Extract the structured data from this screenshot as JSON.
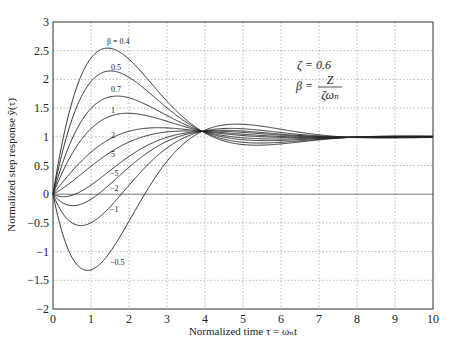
{
  "chart_data": {
    "type": "line",
    "title": "",
    "xlabel": "Normalized time τ = ωₙt",
    "ylabel": "Normalized step response ỹ(τ)",
    "xlim": [
      0,
      10
    ],
    "ylim": [
      -2,
      3
    ],
    "xticks": [
      0,
      1,
      2,
      3,
      4,
      5,
      6,
      7,
      8,
      9,
      10
    ],
    "yticks": [
      -2,
      -1.5,
      -1,
      -0.5,
      0,
      0.5,
      1,
      1.5,
      2,
      2.5,
      3
    ],
    "ytick_labels": [
      "−2",
      "−1.5",
      "−1",
      "−0.5",
      "0",
      "0.5",
      "1",
      "1.5",
      "2",
      "2.5",
      "3"
    ],
    "grid": true,
    "zeta": 0.6,
    "model": "y(τ) = y0(τ) + (1/(βζ))·dy0/dτ, second-order step response with zero",
    "annotations": {
      "zeta_text": "ζ = 0.6",
      "beta_lhs": "β =",
      "beta_num": "Z",
      "beta_den": "ζωₙ"
    },
    "series": [
      {
        "name": "β = 0.4",
        "beta": 0.4,
        "label": "β = 0.4",
        "peak": [
          1.45,
          2.55
        ]
      },
      {
        "name": "β = 0.5",
        "beta": 0.5,
        "label": "0.5",
        "peak": [
          1.45,
          2.13
        ]
      },
      {
        "name": "β = 0.7",
        "beta": 0.7,
        "label": "0.7",
        "peak": [
          1.55,
          1.7
        ]
      },
      {
        "name": "β = 1",
        "beta": 1,
        "label": "1",
        "peak": [
          1.8,
          1.42
        ]
      },
      {
        "name": "β = 2",
        "beta": 2,
        "label": "2",
        "peak": [
          2.7,
          1.14
        ]
      },
      {
        "name": "β = 5",
        "beta": 5,
        "label": "5",
        "peak": [
          3.3,
          1.1
        ]
      },
      {
        "name": "β = -5",
        "beta": -5,
        "label": "−5",
        "peak": [
          4.6,
          1.12
        ]
      },
      {
        "name": "β = -2",
        "beta": -2,
        "label": "−2",
        "peak": [
          4.8,
          1.15
        ]
      },
      {
        "name": "β = -1",
        "beta": -1,
        "label": "−1",
        "min": [
          0.7,
          -0.55
        ]
      },
      {
        "name": "β = -0.5",
        "beta": -0.5,
        "label": "−0.5",
        "min": [
          0.95,
          -1.35
        ]
      }
    ],
    "convergence_point": [
      3.9,
      1.1
    ],
    "steady_state": 1.0
  }
}
